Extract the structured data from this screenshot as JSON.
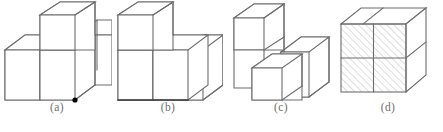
{
  "panel": {
    "title": "Cube arrangement multiple choice figures",
    "background_color": "#ffffff",
    "line_color": "#6d6d6d",
    "dark_line_color": "#3c3c3c",
    "hatch_color": "#b7b7b7",
    "marker_color": "#000000",
    "caption_color": "#6e6e6e"
  },
  "figures": [
    {
      "id": "a",
      "caption": "(a)",
      "description": "Three unit cubes: two side-by-side on the bottom row with one cube stacked on the back-left top, plus one cube to the right",
      "cube_count": 3,
      "has_marker": true,
      "marker_label": "black-dot-vertex",
      "hatched": false
    },
    {
      "id": "b",
      "caption": "(b)",
      "description": "Three unit cubes: two in a bottom row with one cube stacked on the left, and one cube at the right rear",
      "cube_count": 3,
      "has_marker": false,
      "marker_label": "",
      "hatched": false
    },
    {
      "id": "c",
      "caption": "(c)",
      "description": "Three unit cubes: one stacked at upper-left, one at right rear, and one offset forward at lower-middle",
      "cube_count": 3,
      "has_marker": false,
      "marker_label": "",
      "hatched": false
    },
    {
      "id": "d",
      "caption": "(d)",
      "description": "Four unit cubes forming a 2 by 2 block with hatched shading on the front face",
      "cube_count": 4,
      "has_marker": false,
      "marker_label": "",
      "hatched": true
    }
  ]
}
